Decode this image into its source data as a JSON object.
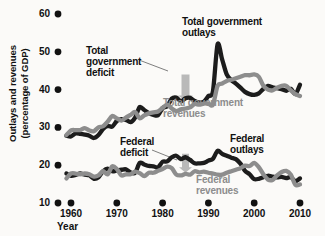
{
  "chart_data": {
    "type": "line",
    "title": "",
    "xlabel": "Year",
    "ylabel": "Outlays and revenues (percentage of GDP)",
    "ylabel_lines": [
      "Outlays and revenues",
      "(percentage of GDP)"
    ],
    "xlim": [
      1958,
      2011
    ],
    "ylim": [
      10,
      60
    ],
    "xticks": [
      1960,
      1970,
      1980,
      1990,
      2000,
      2010
    ],
    "xtick_labels": [
      "1960",
      "1970",
      "1980",
      "1990",
      "2000",
      "2010"
    ],
    "yticks": [
      10,
      20,
      30,
      40,
      50,
      60
    ],
    "ytick_labels": [
      "10",
      "20",
      "30",
      "40",
      "50",
      "60"
    ],
    "grid": false,
    "legend_position": "inline-annotations",
    "tick_marker": "filled-dot",
    "colors": {
      "outlays": "#1c1c1c",
      "revenues": "#8d8d8d",
      "deficit_arrow": "#b9b9b9",
      "background": "#fbfaf8",
      "text": "#111111"
    },
    "series": [
      {
        "name": "Total government outlays",
        "color": "#1c1c1c",
        "x": [
          1959,
          1960,
          1961,
          1962,
          1963,
          1964,
          1965,
          1966,
          1967,
          1968,
          1969,
          1970,
          1971,
          1972,
          1973,
          1974,
          1975,
          1976,
          1977,
          1978,
          1979,
          1980,
          1981,
          1982,
          1983,
          1984,
          1985,
          1986,
          1987,
          1988,
          1989,
          1990,
          1991,
          1992,
          1993,
          1994,
          1995,
          1996,
          1997,
          1998,
          1999,
          2000,
          2001,
          2002,
          2003,
          2004,
          2005,
          2006,
          2007,
          2008,
          2009,
          2010
        ],
        "values": [
          27.8,
          27.6,
          28.4,
          28.3,
          28.1,
          27.8,
          27.2,
          28.0,
          29.6,
          30.4,
          30.2,
          31.7,
          32.2,
          32.0,
          31.4,
          32.6,
          35.4,
          34.6,
          33.8,
          33.3,
          33.2,
          35.1,
          35.6,
          37.6,
          37.9,
          36.9,
          37.7,
          37.8,
          37.0,
          36.6,
          36.8,
          38.3,
          39.6,
          52.0,
          48.0,
          44.0,
          42.5,
          41.6,
          40.5,
          39.4,
          38.8,
          38.6,
          39.0,
          40.2,
          41.0,
          40.6,
          40.4,
          40.1,
          39.7,
          40.2,
          38.8,
          41.3
        ]
      },
      {
        "name": "Total government revenues",
        "color": "#8d8d8d",
        "x": [
          1959,
          1960,
          1961,
          1962,
          1963,
          1964,
          1965,
          1966,
          1967,
          1968,
          1969,
          1970,
          1971,
          1972,
          1973,
          1974,
          1975,
          1976,
          1977,
          1978,
          1979,
          1980,
          1981,
          1982,
          1983,
          1984,
          1985,
          1986,
          1987,
          1988,
          1989,
          1990,
          1991,
          1992,
          1993,
          1994,
          1995,
          1996,
          1997,
          1998,
          1999,
          2000,
          2001,
          2002,
          2003,
          2004,
          2005,
          2006,
          2007,
          2008,
          2009,
          2010
        ],
        "values": [
          28.0,
          29.2,
          29.3,
          29.3,
          29.8,
          29.2,
          29.0,
          30.0,
          30.3,
          31.5,
          33.0,
          32.4,
          31.8,
          32.6,
          33.3,
          34.1,
          32.4,
          33.2,
          33.7,
          34.0,
          34.2,
          35.2,
          36.0,
          35.0,
          34.3,
          34.8,
          35.0,
          35.3,
          36.2,
          36.0,
          36.3,
          36.3,
          36.0,
          41.0,
          41.6,
          42.3,
          42.6,
          43.0,
          43.4,
          43.8,
          43.8,
          44.0,
          43.4,
          41.0,
          40.0,
          39.8,
          40.5,
          41.0,
          41.0,
          39.8,
          38.8,
          38.3
        ]
      },
      {
        "name": "Federal outlays",
        "color": "#1c1c1c",
        "x": [
          1959,
          1960,
          1961,
          1962,
          1963,
          1964,
          1965,
          1966,
          1967,
          1968,
          1969,
          1970,
          1971,
          1972,
          1973,
          1974,
          1975,
          1976,
          1977,
          1978,
          1979,
          1980,
          1981,
          1982,
          1983,
          1984,
          1985,
          1986,
          1987,
          1988,
          1989,
          1990,
          1991,
          1992,
          1993,
          1994,
          1995,
          1996,
          1997,
          1998,
          1999,
          2000,
          2001,
          2002,
          2003,
          2004,
          2005,
          2006,
          2007,
          2008,
          2009,
          2010
        ],
        "values": [
          17.8,
          17.2,
          17.4,
          17.8,
          17.5,
          17.3,
          16.4,
          16.8,
          18.4,
          19.1,
          18.4,
          18.6,
          18.8,
          18.9,
          18.1,
          18.0,
          20.6,
          20.2,
          19.8,
          19.7,
          19.4,
          20.9,
          21.0,
          22.1,
          22.5,
          21.6,
          22.1,
          21.4,
          20.5,
          20.5,
          20.6,
          21.2,
          21.7,
          23.8,
          23.0,
          22.5,
          22.0,
          21.6,
          20.4,
          18.5,
          17.6,
          16.3,
          16.4,
          16.8,
          17.2,
          17.0,
          16.8,
          16.9,
          16.6,
          16.8,
          15.8,
          16.5
        ]
      },
      {
        "name": "Federal revenues",
        "color": "#8d8d8d",
        "x": [
          1959,
          1960,
          1961,
          1962,
          1963,
          1964,
          1965,
          1966,
          1967,
          1968,
          1969,
          1970,
          1971,
          1972,
          1973,
          1974,
          1975,
          1976,
          1977,
          1978,
          1979,
          1980,
          1981,
          1982,
          1983,
          1984,
          1985,
          1986,
          1987,
          1988,
          1989,
          1990,
          1991,
          1992,
          1993,
          1994,
          1995,
          1996,
          1997,
          1998,
          1999,
          2000,
          2001,
          2002,
          2003,
          2004,
          2005,
          2006,
          2007,
          2008,
          2009,
          2010
        ],
        "values": [
          16.5,
          17.8,
          17.8,
          17.6,
          17.8,
          17.6,
          17.0,
          17.3,
          18.4,
          17.6,
          19.7,
          19.0,
          17.3,
          17.6,
          17.6,
          18.3,
          17.9,
          17.1,
          18.0,
          18.0,
          18.5,
          19.0,
          19.6,
          19.2,
          17.5,
          17.3,
          17.7,
          17.5,
          18.4,
          18.1,
          18.3,
          18.0,
          17.8,
          17.5,
          17.5,
          18.0,
          18.4,
          18.8,
          19.2,
          19.9,
          19.8,
          20.6,
          19.5,
          17.6,
          16.2,
          16.1,
          17.3,
          18.2,
          18.5,
          17.5,
          14.8,
          14.9
        ]
      }
    ],
    "annotations": [
      {
        "id": "total-government-outlays",
        "text": "Total government outlays",
        "lines": [
          "Total government",
          "outlays"
        ],
        "style": "dark"
      },
      {
        "id": "total-government-deficit",
        "text": "Total government deficit",
        "lines": [
          "Total",
          "government",
          "deficit"
        ],
        "style": "dark"
      },
      {
        "id": "total-government-revenues",
        "text": "Total government revenues",
        "lines": [
          "Total government",
          "revenues"
        ],
        "style": "gray"
      },
      {
        "id": "federal-deficit",
        "text": "Federal deficit",
        "lines": [
          "Federal",
          "deficit"
        ],
        "style": "dark"
      },
      {
        "id": "federal-outlays",
        "text": "Federal outlays",
        "lines": [
          "Federal",
          "outlays"
        ],
        "style": "dark"
      },
      {
        "id": "federal-revenues",
        "text": "Federal revenues",
        "lines": [
          "Federal",
          "revenues"
        ],
        "style": "gray"
      }
    ]
  }
}
